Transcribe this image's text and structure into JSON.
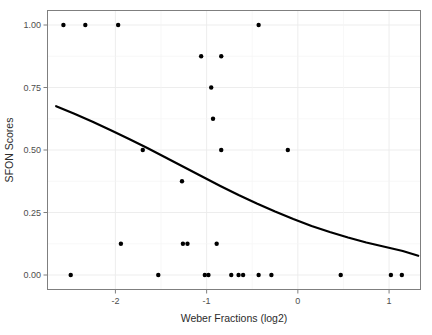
{
  "chart_data": {
    "type": "scatter",
    "title": "",
    "xlabel": "Weber Fractions (log2)",
    "ylabel": "SFON Scores",
    "xlim": [
      -2.75,
      1.35
    ],
    "ylim": [
      -0.06,
      1.06
    ],
    "xticks": [
      -2,
      -1,
      0,
      1
    ],
    "xtick_labels": [
      "-2",
      "-1",
      "0",
      "1"
    ],
    "yticks": [
      0.0,
      0.25,
      0.5,
      0.75,
      1.0
    ],
    "ytick_labels": [
      "0.00",
      "0.25",
      "0.50",
      "0.75",
      "1.00"
    ],
    "grid": true,
    "grid_color": "#ebebeb",
    "panel_border_color": "#7f7f7f",
    "point_color": "#000000",
    "point_size": 2.2,
    "legend": "none",
    "points": [
      {
        "x": -2.57,
        "y": 1.0
      },
      {
        "x": -2.33,
        "y": 1.0
      },
      {
        "x": -1.97,
        "y": 1.0
      },
      {
        "x": -0.43,
        "y": 1.0
      },
      {
        "x": -1.06,
        "y": 0.875
      },
      {
        "x": -0.84,
        "y": 0.875
      },
      {
        "x": -0.95,
        "y": 0.75
      },
      {
        "x": -0.93,
        "y": 0.625
      },
      {
        "x": -1.7,
        "y": 0.5
      },
      {
        "x": -0.84,
        "y": 0.5
      },
      {
        "x": -0.11,
        "y": 0.5
      },
      {
        "x": -1.27,
        "y": 0.375
      },
      {
        "x": -1.94,
        "y": 0.125
      },
      {
        "x": -1.26,
        "y": 0.125
      },
      {
        "x": -1.21,
        "y": 0.125
      },
      {
        "x": -0.89,
        "y": 0.125
      },
      {
        "x": -2.49,
        "y": 0.0
      },
      {
        "x": -1.53,
        "y": 0.0
      },
      {
        "x": -1.02,
        "y": 0.0
      },
      {
        "x": -0.98,
        "y": 0.0
      },
      {
        "x": -0.73,
        "y": 0.0
      },
      {
        "x": -0.65,
        "y": 0.0
      },
      {
        "x": -0.6,
        "y": 0.0
      },
      {
        "x": -0.43,
        "y": 0.0
      },
      {
        "x": -0.29,
        "y": 0.0
      },
      {
        "x": 0.47,
        "y": 0.0
      },
      {
        "x": 1.02,
        "y": 0.0
      },
      {
        "x": 1.14,
        "y": 0.0
      }
    ],
    "fit_curve": {
      "name": "logistic-fit",
      "color": "#000000",
      "width": 2.2,
      "x_start": -2.65,
      "x_end": 1.32,
      "y_start": 0.675,
      "y_end": 0.077,
      "points": [
        {
          "x": -2.65,
          "y": 0.675
        },
        {
          "x": -2.45,
          "y": 0.645
        },
        {
          "x": -2.25,
          "y": 0.613
        },
        {
          "x": -2.05,
          "y": 0.579
        },
        {
          "x": -1.85,
          "y": 0.544
        },
        {
          "x": -1.65,
          "y": 0.508
        },
        {
          "x": -1.45,
          "y": 0.47
        },
        {
          "x": -1.25,
          "y": 0.432
        },
        {
          "x": -1.05,
          "y": 0.394
        },
        {
          "x": -0.85,
          "y": 0.356
        },
        {
          "x": -0.65,
          "y": 0.32
        },
        {
          "x": -0.45,
          "y": 0.286
        },
        {
          "x": -0.25,
          "y": 0.254
        },
        {
          "x": -0.05,
          "y": 0.224
        },
        {
          "x": 0.15,
          "y": 0.196
        },
        {
          "x": 0.35,
          "y": 0.172
        },
        {
          "x": 0.55,
          "y": 0.15
        },
        {
          "x": 0.75,
          "y": 0.13
        },
        {
          "x": 0.95,
          "y": 0.113
        },
        {
          "x": 1.15,
          "y": 0.096
        },
        {
          "x": 1.32,
          "y": 0.077
        }
      ]
    }
  }
}
